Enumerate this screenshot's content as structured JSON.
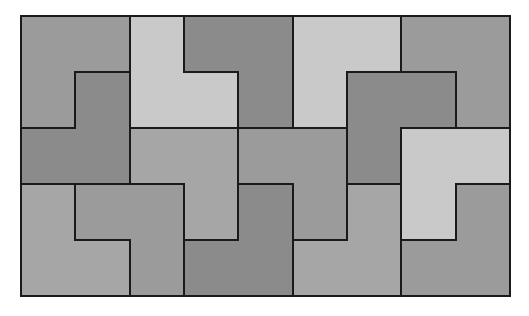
{
  "diagram": {
    "title": "",
    "type": "L-tromino tiling",
    "grid": {
      "cols": 9,
      "rows": 5,
      "x_lines": [
        21,
        75,
        130,
        184,
        238,
        293,
        347,
        401,
        456,
        510
      ],
      "y_lines": [
        16,
        72,
        128,
        184,
        240,
        296
      ]
    },
    "colors": {
      "light": "#c9c9c9",
      "medium": "#a6a6a6",
      "mid_dark": "#9b9b9b",
      "dark": "#8b8b8b",
      "border": "#1a1a1a",
      "background": "#ffffff"
    },
    "pieces": [
      {
        "id": "A",
        "shade": "mid_dark",
        "cells": [
          [
            0,
            0
          ],
          [
            1,
            0
          ],
          [
            0,
            1
          ]
        ]
      },
      {
        "id": "B",
        "shade": "dark",
        "cells": [
          [
            1,
            1
          ],
          [
            0,
            2
          ],
          [
            1,
            2
          ]
        ]
      },
      {
        "id": "C",
        "shade": "light",
        "cells": [
          [
            2,
            0
          ],
          [
            2,
            1
          ],
          [
            3,
            1
          ]
        ]
      },
      {
        "id": "D",
        "shade": "dark",
        "cells": [
          [
            3,
            0
          ],
          [
            4,
            0
          ],
          [
            4,
            1
          ]
        ]
      },
      {
        "id": "E",
        "shade": "light",
        "cells": [
          [
            5,
            0
          ],
          [
            6,
            0
          ],
          [
            5,
            1
          ]
        ]
      },
      {
        "id": "F",
        "shade": "mid_dark",
        "cells": [
          [
            7,
            0
          ],
          [
            8,
            0
          ],
          [
            8,
            1
          ]
        ]
      },
      {
        "id": "G",
        "shade": "dark",
        "cells": [
          [
            6,
            1
          ],
          [
            7,
            1
          ],
          [
            6,
            2
          ]
        ]
      },
      {
        "id": "H",
        "shade": "light",
        "cells": [
          [
            7,
            2
          ],
          [
            8,
            2
          ],
          [
            7,
            3
          ]
        ]
      },
      {
        "id": "I",
        "shade": "medium",
        "cells": [
          [
            2,
            2
          ],
          [
            3,
            2
          ],
          [
            3,
            3
          ]
        ]
      },
      {
        "id": "J",
        "shade": "mid_dark",
        "cells": [
          [
            4,
            2
          ],
          [
            5,
            2
          ],
          [
            5,
            3
          ]
        ]
      },
      {
        "id": "K",
        "shade": "dark",
        "cells": [
          [
            4,
            3
          ],
          [
            3,
            4
          ],
          [
            4,
            4
          ]
        ]
      },
      {
        "id": "L",
        "shade": "medium",
        "cells": [
          [
            0,
            3
          ],
          [
            0,
            4
          ],
          [
            1,
            4
          ]
        ]
      },
      {
        "id": "M",
        "shade": "mid_dark",
        "cells": [
          [
            1,
            3
          ],
          [
            2,
            3
          ],
          [
            2,
            4
          ]
        ]
      },
      {
        "id": "N",
        "shade": "medium",
        "cells": [
          [
            6,
            3
          ],
          [
            5,
            4
          ],
          [
            6,
            4
          ]
        ]
      },
      {
        "id": "O",
        "shade": "mid_dark",
        "cells": [
          [
            8,
            3
          ],
          [
            7,
            4
          ],
          [
            8,
            4
          ]
        ]
      }
    ]
  }
}
